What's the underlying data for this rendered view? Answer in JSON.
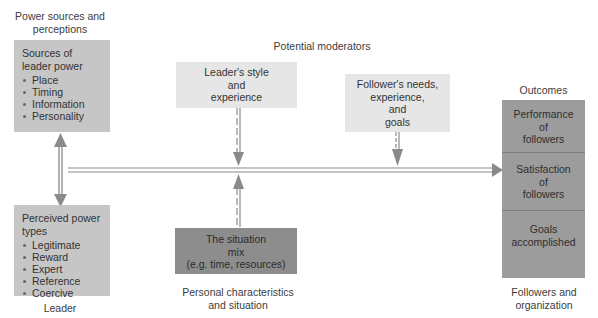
{
  "diagram": {
    "headings": {
      "power_sources": "Power sources and perceptions",
      "potential_moderators": "Potential moderators",
      "outcomes": "Outcomes",
      "leader": "Leader",
      "personal_situation": "Personal characteristics and situation",
      "followers_org": "Followers and organization"
    },
    "sources_box": {
      "title": "Sources of leader power",
      "items": [
        "Place",
        "Timing",
        "Information",
        "Personality"
      ]
    },
    "perceived_box": {
      "title": "Perceived power types",
      "items": [
        "Legitimate",
        "Reward",
        "Expert",
        "Reference",
        "Coercive"
      ]
    },
    "leader_style_box": {
      "lines": [
        "Leader's style",
        "and",
        "experience"
      ]
    },
    "follower_needs_box": {
      "lines": [
        "Follower's needs,",
        "experience,",
        "and",
        "goals"
      ]
    },
    "situation_box": {
      "lines": [
        "The situation",
        "mix",
        "(e.g. time, resources)"
      ]
    },
    "outcome_boxes": [
      {
        "lines": [
          "Performance",
          "of",
          "followers"
        ]
      },
      {
        "lines": [
          "Satisfaction",
          "of",
          "followers"
        ]
      },
      {
        "lines": [
          "Goals",
          "accomplished"
        ]
      }
    ],
    "colors": {
      "left_boxes": "#c6c6c6",
      "moderator_boxes": "#e6e6e6",
      "situation_box": "#8d8d8d",
      "outcome_boxes": "#9c9c9c",
      "arrows": "#8a8a8a"
    }
  }
}
